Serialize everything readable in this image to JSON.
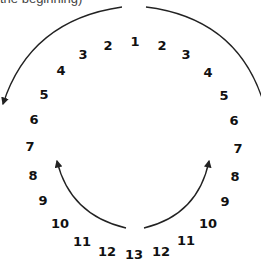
{
  "caption": "the beginning)",
  "colors": {
    "stroke": "#222222",
    "text": "#111111"
  },
  "numbers": [
    {
      "label": "1",
      "x": 135,
      "y": 41
    },
    {
      "label": "2",
      "x": 108,
      "y": 45
    },
    {
      "label": "3",
      "x": 83,
      "y": 54
    },
    {
      "label": "4",
      "x": 61,
      "y": 70
    },
    {
      "label": "5",
      "x": 44,
      "y": 94
    },
    {
      "label": "6",
      "x": 34,
      "y": 119
    },
    {
      "label": "7",
      "x": 30,
      "y": 146
    },
    {
      "label": "8",
      "x": 33,
      "y": 175
    },
    {
      "label": "9",
      "x": 43,
      "y": 200
    },
    {
      "label": "10",
      "x": 60,
      "y": 223
    },
    {
      "label": "11",
      "x": 82,
      "y": 241
    },
    {
      "label": "12",
      "x": 107,
      "y": 251
    },
    {
      "label": "13",
      "x": 134,
      "y": 254
    },
    {
      "label": "2",
      "x": 162,
      "y": 45
    },
    {
      "label": "3",
      "x": 186,
      "y": 54
    },
    {
      "label": "4",
      "x": 208,
      "y": 72
    },
    {
      "label": "5",
      "x": 224,
      "y": 95
    },
    {
      "label": "6",
      "x": 234,
      "y": 120
    },
    {
      "label": "7",
      "x": 238,
      "y": 148
    },
    {
      "label": "8",
      "x": 235,
      "y": 176
    },
    {
      "label": "9",
      "x": 225,
      "y": 201
    },
    {
      "label": "10",
      "x": 208,
      "y": 223
    },
    {
      "label": "11",
      "x": 186,
      "y": 240
    },
    {
      "label": "12",
      "x": 161,
      "y": 251
    }
  ]
}
